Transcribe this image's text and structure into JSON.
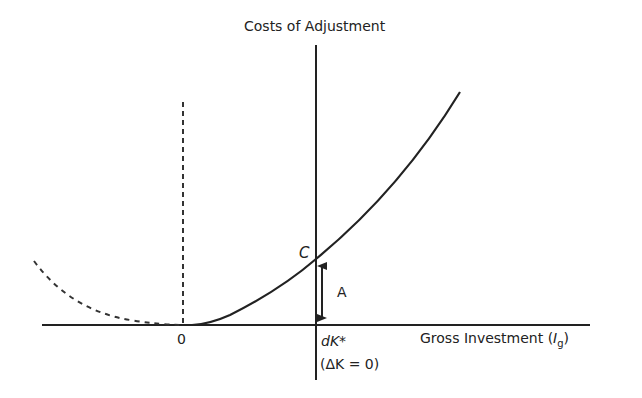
{
  "diagram": {
    "y_axis_label": "Costs of Adjustment",
    "x_axis_label": "Gross Investment (",
    "x_axis_symbol": "I",
    "x_axis_subscript": "g",
    "x_axis_close": ")",
    "origin_label": "0",
    "point_label": "C",
    "arrow_label": "A",
    "equilibrium_label": "dK*",
    "equilibrium_condition": "(ΔK = 0)",
    "colors": {
      "ink": "#222222",
      "background": "#ffffff"
    },
    "curves": [
      {
        "name": "adjustment-cost-curve",
        "style": "solid",
        "description": "convex cost rising for positive gross investment"
      },
      {
        "name": "negative-investment-cost-curve",
        "style": "dashed",
        "description": "cost for negative gross investment"
      }
    ]
  }
}
